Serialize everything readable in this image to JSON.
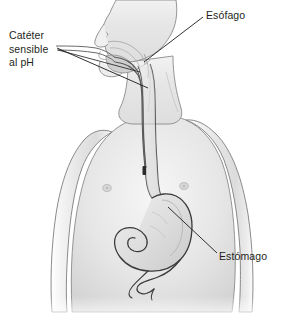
{
  "figure": {
    "width": 285,
    "height": 322,
    "background_color": "#ffffff",
    "style": "grayscale medical illustration"
  },
  "labels": {
    "catheter": {
      "line1": "Catéter",
      "line2": "sensible",
      "line3": "al pH",
      "text_color": "#231f20"
    },
    "esophagus": {
      "text": "Esófago",
      "text_color": "#231f20"
    },
    "stomach": {
      "text": "Estómago",
      "text_color": "#231f20"
    }
  },
  "anatomy": {
    "body_fill": "#e9e9e9",
    "body_outline": "#6e6e6e",
    "organ_outline": "#3a3a3a",
    "catheter_color": "#4a4a4a",
    "catheter_tip_color": "#2b2b2b",
    "leader_line_color": "#1a1a1a",
    "parts": [
      "head-profile",
      "neck",
      "torso",
      "left-arm",
      "right-arm",
      "nipple-left",
      "nipple-right",
      "nasal-cavity",
      "tongue",
      "esophagus",
      "stomach",
      "duodenum",
      "catheter-tube",
      "catheter-tip"
    ]
  }
}
